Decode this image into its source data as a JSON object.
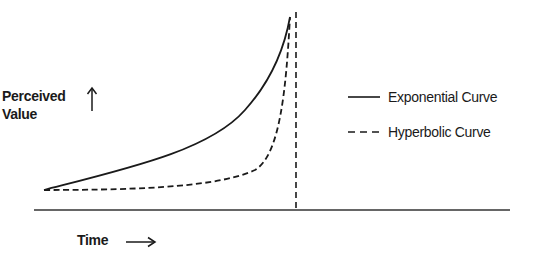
{
  "diagram": {
    "y_axis_label_line1": "Perceived",
    "y_axis_label_line2": "Value",
    "x_axis_label": "Time",
    "legend": [
      {
        "label": "Exponential Curve",
        "style": "solid"
      },
      {
        "label": "Hyperbolic Curve",
        "style": "dashed"
      }
    ],
    "line_color": "#1a1a1a",
    "baseline_color": "#333333"
  }
}
